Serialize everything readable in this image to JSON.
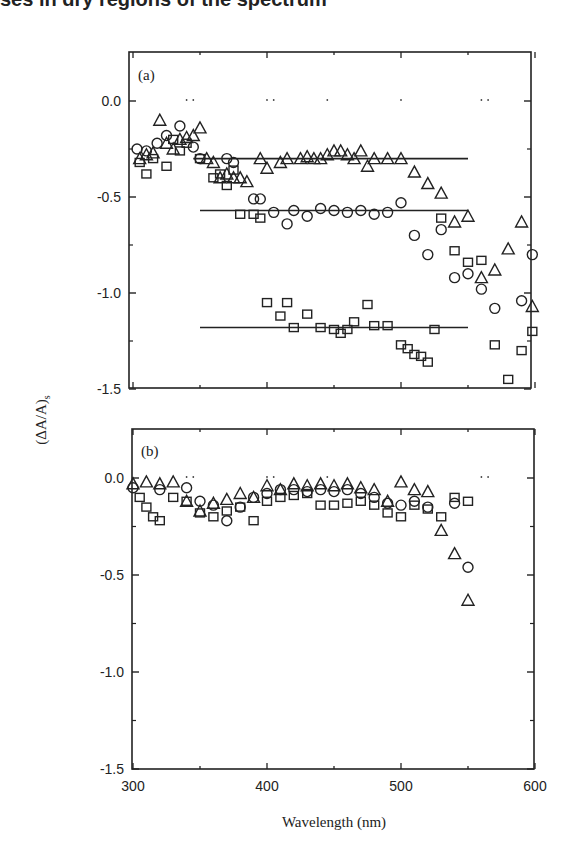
{
  "header_cut_text": "ses in dry regions of the spectrum",
  "chart_data": [
    {
      "type": "scatter",
      "panel": "(a)",
      "xlabel": "Wavelength (nm)",
      "ylabel": "(ΔA/A)s",
      "xlim": [
        300,
        600
      ],
      "ylim": [
        -1.5,
        0.25
      ],
      "xticks": [
        300,
        400,
        500,
        600
      ],
      "yticks": [
        "0.0",
        "-0.5",
        "-1.0",
        "-1.5"
      ],
      "grid": false,
      "legend": null,
      "series": [
        {
          "name": "triangles",
          "marker": "triangle",
          "x": [
            305,
            310,
            315,
            320,
            325,
            330,
            335,
            340,
            345,
            350,
            355,
            360,
            365,
            370,
            375,
            380,
            385,
            395,
            400,
            410,
            415,
            425,
            430,
            435,
            440,
            445,
            450,
            455,
            460,
            465,
            470,
            475,
            480,
            490,
            500,
            510,
            520,
            530,
            540,
            550,
            560,
            570,
            580,
            590,
            598
          ],
          "y": [
            -0.3,
            -0.28,
            -0.27,
            -0.1,
            -0.22,
            -0.25,
            -0.2,
            -0.19,
            -0.18,
            -0.14,
            -0.3,
            -0.32,
            -0.4,
            -0.38,
            -0.4,
            -0.4,
            -0.42,
            -0.3,
            -0.35,
            -0.32,
            -0.3,
            -0.3,
            -0.29,
            -0.3,
            -0.3,
            -0.28,
            -0.26,
            -0.26,
            -0.28,
            -0.3,
            -0.26,
            -0.34,
            -0.3,
            -0.3,
            -0.3,
            -0.37,
            -0.43,
            -0.48,
            -0.63,
            -0.6,
            -0.92,
            -0.88,
            -0.77,
            -0.63,
            -1.07
          ]
        },
        {
          "name": "circles",
          "marker": "circle",
          "x": [
            303,
            310,
            318,
            325,
            335,
            345,
            350,
            370,
            375,
            390,
            395,
            405,
            415,
            420,
            430,
            440,
            450,
            460,
            470,
            480,
            490,
            500,
            510,
            520,
            530,
            540,
            550,
            560,
            570,
            590,
            598
          ],
          "y": [
            -0.25,
            -0.26,
            -0.22,
            -0.18,
            -0.13,
            -0.24,
            -0.3,
            -0.3,
            -0.32,
            -0.51,
            -0.51,
            -0.58,
            -0.64,
            -0.57,
            -0.6,
            -0.56,
            -0.57,
            -0.58,
            -0.57,
            -0.59,
            -0.58,
            -0.53,
            -0.7,
            -0.8,
            -0.67,
            -0.92,
            -0.9,
            -0.98,
            -1.08,
            -1.04,
            -0.8
          ]
        },
        {
          "name": "squares",
          "marker": "square",
          "x": [
            305,
            310,
            315,
            325,
            330,
            335,
            340,
            350,
            360,
            365,
            370,
            375,
            380,
            390,
            395,
            400,
            410,
            415,
            420,
            430,
            440,
            450,
            455,
            460,
            465,
            475,
            480,
            490,
            500,
            505,
            510,
            515,
            520,
            525,
            530,
            540,
            550,
            560,
            570,
            580,
            590,
            598
          ],
          "y": [
            -0.32,
            -0.38,
            -0.3,
            -0.34,
            -0.2,
            -0.26,
            -0.22,
            -0.3,
            -0.4,
            -0.38,
            -0.44,
            -0.36,
            -0.59,
            -0.59,
            -0.61,
            -1.05,
            -1.12,
            -1.05,
            -1.18,
            -1.11,
            -1.18,
            -1.19,
            -1.21,
            -1.19,
            -1.15,
            -1.06,
            -1.17,
            -1.17,
            -1.27,
            -1.29,
            -1.32,
            -1.33,
            -1.36,
            -1.19,
            -0.61,
            -0.78,
            -0.84,
            -0.83,
            -1.27,
            -1.45,
            -1.3,
            -1.2
          ]
        }
      ],
      "fit_lines": [
        {
          "x": [
            345,
            550
          ],
          "y": [
            -0.3,
            -0.3
          ]
        },
        {
          "x": [
            350,
            550
          ],
          "y": [
            -0.57,
            -0.57
          ]
        },
        {
          "x": [
            350,
            550
          ],
          "y": [
            -1.18,
            -1.18
          ]
        }
      ]
    },
    {
      "type": "scatter",
      "panel": "(b)",
      "xlabel": "Wavelength (nm)",
      "ylabel": "(ΔA/A)s",
      "xlim": [
        300,
        600
      ],
      "ylim": [
        -1.5,
        0.25
      ],
      "xticks": [
        300,
        400,
        500,
        600
      ],
      "yticks": [
        "0.0",
        "-0.5",
        "-1.0",
        "-1.5"
      ],
      "grid": false,
      "legend": null,
      "series": [
        {
          "name": "triangles",
          "marker": "triangle",
          "x": [
            300,
            310,
            320,
            330,
            340,
            350,
            360,
            370,
            380,
            390,
            400,
            410,
            420,
            430,
            440,
            450,
            460,
            470,
            480,
            490,
            500,
            510,
            520,
            530,
            540,
            550
          ],
          "y": [
            -0.03,
            -0.02,
            -0.03,
            -0.02,
            -0.12,
            -0.17,
            -0.13,
            -0.11,
            -0.08,
            -0.1,
            -0.04,
            -0.06,
            -0.03,
            -0.04,
            -0.03,
            -0.04,
            -0.03,
            -0.05,
            -0.06,
            -0.12,
            -0.02,
            -0.06,
            -0.07,
            -0.27,
            -0.39,
            -0.63
          ]
        },
        {
          "name": "circles",
          "marker": "circle",
          "x": [
            300,
            320,
            340,
            350,
            360,
            370,
            380,
            390,
            400,
            410,
            420,
            430,
            440,
            450,
            460,
            470,
            480,
            490,
            500,
            510,
            520,
            540,
            550
          ],
          "y": [
            -0.05,
            -0.06,
            -0.05,
            -0.12,
            -0.14,
            -0.22,
            -0.15,
            -0.1,
            -0.08,
            -0.06,
            -0.06,
            -0.07,
            -0.06,
            -0.07,
            -0.06,
            -0.08,
            -0.1,
            -0.13,
            -0.14,
            -0.12,
            -0.15,
            -0.13,
            -0.46
          ]
        },
        {
          "name": "squares",
          "marker": "square",
          "x": [
            305,
            310,
            315,
            320,
            330,
            340,
            350,
            360,
            370,
            380,
            390,
            400,
            410,
            420,
            430,
            440,
            450,
            460,
            470,
            480,
            490,
            500,
            510,
            520,
            530,
            540,
            550
          ],
          "y": [
            -0.1,
            -0.15,
            -0.2,
            -0.22,
            -0.1,
            -0.12,
            -0.18,
            -0.2,
            -0.17,
            -0.15,
            -0.22,
            -0.12,
            -0.1,
            -0.09,
            -0.08,
            -0.14,
            -0.14,
            -0.13,
            -0.12,
            -0.14,
            -0.18,
            -0.2,
            -0.14,
            -0.16,
            -0.2,
            -0.1,
            -0.12
          ]
        }
      ],
      "fit_lines": []
    }
  ],
  "panels": {
    "a": {
      "label": "(a)"
    },
    "b": {
      "label": "(b)"
    }
  },
  "axes": {
    "y_tick_labels": [
      "0.0",
      "-0.5",
      "-1.0",
      "-1.5"
    ],
    "x_tick_labels": [
      "300",
      "400",
      "500",
      "600"
    ],
    "x_title": "Wavelength (nm)",
    "y_title": "(ΔA/A)",
    "y_title_subscript": "s"
  }
}
